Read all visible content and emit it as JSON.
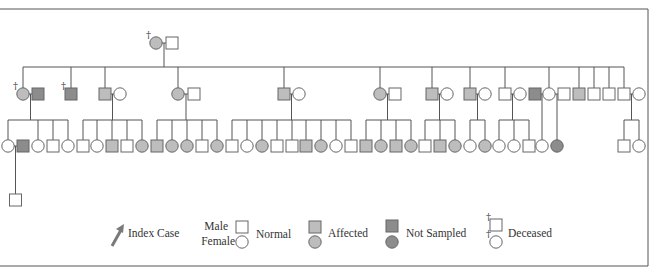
{
  "colors": {
    "line": "#555555",
    "normal_fill": "#ffffff",
    "affected_fill": "#bdbdbd",
    "not_sampled_fill": "#8c8c8c",
    "arrow": "#7a7a7a"
  },
  "legend": {
    "index_case": "Index Case",
    "male": "Male",
    "female": "Female",
    "normal": "Normal",
    "affected": "Affected",
    "not_sampled": "Not Sampled",
    "deceased": "Deceased",
    "deceased_mark": "†"
  },
  "generations": [
    {
      "id": "I",
      "individuals": [
        {
          "id": "I-1",
          "sex": "F",
          "status": "affected",
          "deceased": true
        },
        {
          "id": "I-2",
          "sex": "M",
          "status": "normal",
          "deceased": false
        }
      ]
    },
    {
      "id": "II",
      "individuals": [
        {
          "id": "II-1",
          "sex": "F",
          "status": "affected",
          "deceased": true,
          "spouse": "II-1s"
        },
        {
          "id": "II-1s",
          "sex": "M",
          "status": "not_sampled"
        },
        {
          "id": "II-2",
          "sex": "M",
          "status": "not_sampled",
          "deceased": true
        },
        {
          "id": "II-3",
          "sex": "M",
          "status": "affected",
          "spouse": "II-3s"
        },
        {
          "id": "II-3s",
          "sex": "F",
          "status": "normal"
        },
        {
          "id": "II-4",
          "sex": "F",
          "status": "affected",
          "spouse": "II-4s"
        },
        {
          "id": "II-4s",
          "sex": "M",
          "status": "normal"
        },
        {
          "id": "II-5",
          "sex": "M",
          "status": "affected",
          "spouse": "II-5s"
        },
        {
          "id": "II-5s",
          "sex": "F",
          "status": "normal"
        },
        {
          "id": "II-6",
          "sex": "F",
          "status": "affected",
          "spouse": "II-6s"
        },
        {
          "id": "II-6s",
          "sex": "M",
          "status": "normal"
        },
        {
          "id": "II-7",
          "sex": "M",
          "status": "affected",
          "spouse": "II-7s"
        },
        {
          "id": "II-7s",
          "sex": "F",
          "status": "normal"
        },
        {
          "id": "II-8",
          "sex": "M",
          "status": "affected",
          "spouse": "II-8s"
        },
        {
          "id": "II-8s",
          "sex": "F",
          "status": "normal"
        },
        {
          "id": "II-9",
          "sex": "M",
          "status": "normal",
          "spouse": "II-9s"
        },
        {
          "id": "II-9s",
          "sex": "F",
          "status": "normal"
        },
        {
          "id": "II-10s1",
          "sex": "M",
          "status": "not_sampled"
        },
        {
          "id": "II-10",
          "sex": "F",
          "status": "normal"
        },
        {
          "id": "II-10s2",
          "sex": "M",
          "status": "normal"
        },
        {
          "id": "II-11",
          "sex": "M",
          "status": "affected"
        },
        {
          "id": "II-12",
          "sex": "M",
          "status": "normal"
        },
        {
          "id": "II-13",
          "sex": "M",
          "status": "normal"
        },
        {
          "id": "II-14",
          "sex": "M",
          "status": "normal",
          "spouse": "II-14s"
        },
        {
          "id": "II-14s",
          "sex": "F",
          "status": "normal"
        }
      ]
    },
    {
      "id": "III",
      "sibships": [
        {
          "parents": "II-1",
          "children": [
            {
              "sex": "F",
              "status": "normal"
            },
            {
              "sex": "F",
              "status": "normal"
            },
            {
              "sex": "M",
              "status": "normal"
            },
            {
              "sex": "F",
              "status": "normal"
            }
          ]
        },
        {
          "parents": "II-3",
          "children": [
            {
              "sex": "M",
              "status": "normal"
            },
            {
              "sex": "F",
              "status": "normal"
            },
            {
              "sex": "M",
              "status": "affected"
            },
            {
              "sex": "M",
              "status": "normal"
            },
            {
              "sex": "F",
              "status": "affected"
            }
          ]
        },
        {
          "parents": "II-4",
          "children": [
            {
              "sex": "M",
              "status": "affected"
            },
            {
              "sex": "F",
              "status": "affected"
            },
            {
              "sex": "F",
              "status": "affected"
            },
            {
              "sex": "M",
              "status": "normal"
            },
            {
              "sex": "F",
              "status": "affected"
            }
          ]
        },
        {
          "parents": "II-5",
          "children": [
            {
              "sex": "M",
              "status": "normal"
            },
            {
              "sex": "F",
              "status": "normal"
            },
            {
              "sex": "F",
              "status": "affected"
            },
            {
              "sex": "M",
              "status": "normal"
            },
            {
              "sex": "M",
              "status": "normal"
            },
            {
              "sex": "M",
              "status": "affected"
            },
            {
              "sex": "F",
              "status": "affected"
            },
            {
              "sex": "F",
              "status": "normal"
            },
            {
              "sex": "M",
              "status": "normal"
            }
          ]
        },
        {
          "parents": "II-6",
          "children": [
            {
              "sex": "M",
              "status": "affected"
            },
            {
              "sex": "F",
              "status": "affected"
            },
            {
              "sex": "M",
              "status": "affected"
            },
            {
              "sex": "F",
              "status": "affected"
            }
          ]
        },
        {
          "parents": "II-7",
          "children": [
            {
              "sex": "M",
              "status": "normal"
            },
            {
              "sex": "M",
              "status": "affected"
            },
            {
              "sex": "F",
              "status": "affected"
            }
          ]
        },
        {
          "parents": "II-8",
          "children": [
            {
              "sex": "F",
              "status": "normal"
            },
            {
              "sex": "F",
              "status": "affected"
            }
          ]
        },
        {
          "parents": "II-9",
          "children": [
            {
              "sex": "F",
              "status": "normal"
            },
            {
              "sex": "F",
              "status": "normal"
            },
            {
              "sex": "M",
              "status": "normal"
            }
          ]
        },
        {
          "parents": "II-10 x II-10s1",
          "children": [
            {
              "sex": "F",
              "status": "normal"
            }
          ]
        },
        {
          "parents": "II-10 x II-10s2",
          "children": [
            {
              "sex": "F",
              "status": "not_sampled"
            }
          ]
        },
        {
          "parents": "II-14",
          "children": [
            {
              "sex": "M",
              "status": "normal"
            },
            {
              "sex": "F",
              "status": "normal"
            }
          ]
        }
      ],
      "spouses": [
        {
          "of": "III-1",
          "sex": "M",
          "status": "not_sampled"
        }
      ]
    },
    {
      "id": "IV",
      "individuals": [
        {
          "id": "IV-1",
          "parents": "III-1",
          "sex": "M",
          "status": "normal"
        }
      ]
    }
  ]
}
